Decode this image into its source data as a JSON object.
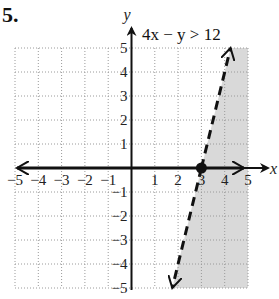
{
  "problem": {
    "number": "5."
  },
  "chart_data": {
    "type": "line",
    "title": "4x − y > 12",
    "inequality": "4x - y > 12",
    "boundary_line": {
      "equation": "y = 4x - 12",
      "style": "dashed",
      "points": [
        [
          1.75,
          -5
        ],
        [
          3,
          0
        ],
        [
          4.25,
          5
        ]
      ]
    },
    "shaded_region": "right of the line (below/right), x > (y+12)/4",
    "highlighted_point": {
      "x": 3,
      "y": 0,
      "label": "3"
    },
    "xlabel": "x",
    "ylabel": "y",
    "xlim": [
      -5,
      5
    ],
    "ylim": [
      -5,
      5
    ],
    "x_ticks": [
      "-5",
      "-4",
      "-3",
      "-2",
      "-1",
      "1",
      "2",
      "3",
      "4",
      "5"
    ],
    "y_ticks": [
      "5",
      "4",
      "3",
      "2",
      "1",
      "-1",
      "-2",
      "-3",
      "-4",
      "-5"
    ],
    "grid": true,
    "colors": {
      "shade": "#d9d9d9",
      "line": "#111111",
      "grid": "#9a9a9a"
    }
  }
}
